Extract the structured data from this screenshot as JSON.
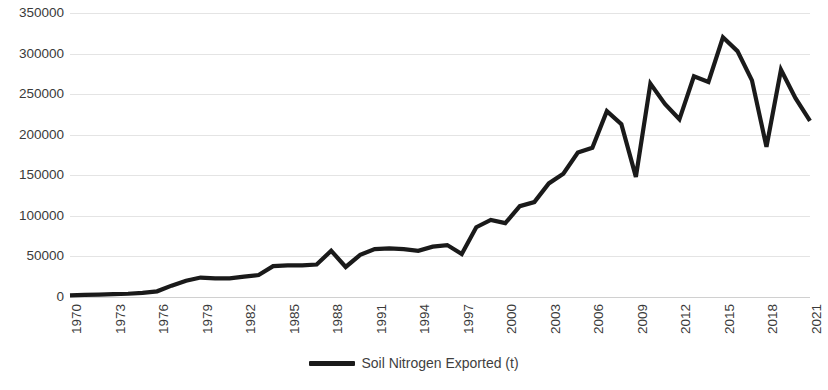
{
  "chart_data": {
    "type": "line",
    "title": "",
    "xlabel": "",
    "ylabel": "",
    "grid": true,
    "legend_position": "bottom",
    "xlim": [
      1970,
      2021
    ],
    "ylim": [
      0,
      350000
    ],
    "y_ticks": [
      0,
      50000,
      100000,
      150000,
      200000,
      250000,
      300000,
      350000
    ],
    "y_tick_labels": [
      "0",
      "50000",
      "100000",
      "150000",
      "200000",
      "250000",
      "300000",
      "350000"
    ],
    "x_ticks": [
      1970,
      1973,
      1976,
      1979,
      1982,
      1985,
      1988,
      1991,
      1994,
      1997,
      2000,
      2003,
      2006,
      2009,
      2012,
      2015,
      2018,
      2021
    ],
    "x_tick_labels": [
      "1970",
      "1973",
      "1976",
      "1979",
      "1982",
      "1985",
      "1988",
      "1991",
      "1994",
      "1997",
      "2000",
      "2003",
      "2006",
      "2009",
      "2012",
      "2015",
      "2018",
      "2021"
    ],
    "x": [
      1970,
      1971,
      1972,
      1973,
      1974,
      1975,
      1976,
      1977,
      1978,
      1979,
      1980,
      1981,
      1982,
      1983,
      1984,
      1985,
      1986,
      1987,
      1988,
      1989,
      1990,
      1991,
      1992,
      1993,
      1994,
      1995,
      1996,
      1997,
      1998,
      1999,
      2000,
      2001,
      2002,
      2003,
      2004,
      2005,
      2006,
      2007,
      2008,
      2009,
      2010,
      2011,
      2012,
      2013,
      2014,
      2015,
      2016,
      2017,
      2018,
      2019,
      2020,
      2021
    ],
    "series": [
      {
        "name": "Soil Nitrogen Exported (t)",
        "color": "#1a1a1a",
        "values": [
          2000,
          2500,
          3000,
          3500,
          4000,
          5000,
          7000,
          14000,
          20000,
          24000,
          23000,
          23000,
          25000,
          27000,
          38000,
          39000,
          39000,
          40000,
          57000,
          37000,
          52000,
          59000,
          60000,
          59000,
          57000,
          62000,
          64000,
          53000,
          86000,
          95000,
          91000,
          112000,
          117000,
          140000,
          152000,
          178000,
          184000,
          229000,
          213000,
          148000,
          263000,
          238000,
          219000,
          272000,
          265000,
          320000,
          303000,
          267000,
          185000,
          280000,
          245000,
          217000
        ]
      }
    ]
  },
  "legend": {
    "items": [
      {
        "label": "Soil Nitrogen Exported (t)",
        "color": "#1a1a1a"
      }
    ]
  },
  "axes": {
    "y_axis_name": "value-axis",
    "x_axis_name": "year-axis"
  }
}
